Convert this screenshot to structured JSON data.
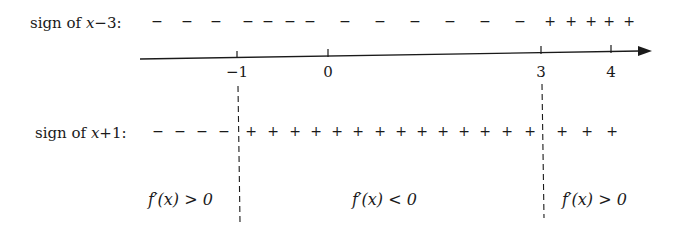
{
  "row1": {
    "label_prefix": "sign of ",
    "label_expr": "x",
    "label_suffix": "−3:",
    "signs": [
      {
        "s": "−",
        "x": 157
      },
      {
        "s": "−",
        "x": 187
      },
      {
        "s": "−",
        "x": 216
      },
      {
        "s": "−",
        "x": 248
      },
      {
        "s": "−",
        "x": 268
      },
      {
        "s": "−",
        "x": 290
      },
      {
        "s": "−",
        "x": 310
      },
      {
        "s": "−",
        "x": 345
      },
      {
        "s": "−",
        "x": 380
      },
      {
        "s": "−",
        "x": 415
      },
      {
        "s": "−",
        "x": 450
      },
      {
        "s": "−",
        "x": 485
      },
      {
        "s": "−",
        "x": 520
      },
      {
        "s": "+",
        "x": 550
      },
      {
        "s": "+",
        "x": 571
      },
      {
        "s": "+",
        "x": 591
      },
      {
        "s": "+",
        "x": 609
      },
      {
        "s": "+",
        "x": 629
      }
    ]
  },
  "axis": {
    "ticks": [
      {
        "label": "−1",
        "x": 237
      },
      {
        "label": "0",
        "x": 328
      },
      {
        "label": "3",
        "x": 541
      },
      {
        "label": "4",
        "x": 611
      }
    ]
  },
  "row2": {
    "label_prefix": "sign of ",
    "label_expr": "x",
    "label_suffix": "+1:",
    "signs": [
      {
        "s": "−",
        "x": 158
      },
      {
        "s": "−",
        "x": 180
      },
      {
        "s": "−",
        "x": 202
      },
      {
        "s": "−",
        "x": 224
      },
      {
        "s": "+",
        "x": 251
      },
      {
        "s": "+",
        "x": 273
      },
      {
        "s": "+",
        "x": 295
      },
      {
        "s": "+",
        "x": 316
      },
      {
        "s": "+",
        "x": 337
      },
      {
        "s": "+",
        "x": 358
      },
      {
        "s": "+",
        "x": 380
      },
      {
        "s": "+",
        "x": 401
      },
      {
        "s": "+",
        "x": 422
      },
      {
        "s": "+",
        "x": 443
      },
      {
        "s": "+",
        "x": 464
      },
      {
        "s": "+",
        "x": 485
      },
      {
        "s": "+",
        "x": 507
      },
      {
        "s": "+",
        "x": 530
      },
      {
        "s": "+",
        "x": 562
      },
      {
        "s": "+",
        "x": 587
      },
      {
        "s": "+",
        "x": 612
      }
    ]
  },
  "regions": [
    {
      "text": "f′(x) > 0",
      "x": 148
    },
    {
      "text": "f′(x) < 0",
      "x": 352
    },
    {
      "text": "f′(x) > 0",
      "x": 562
    }
  ]
}
